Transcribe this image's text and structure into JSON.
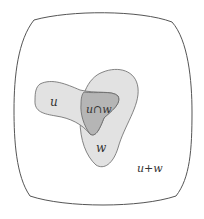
{
  "diagram": {
    "type": "venn",
    "labels": {
      "set_u": "u",
      "intersection": "u∩w",
      "set_w": "w",
      "sum": "u+w"
    },
    "colors": {
      "background": "#ffffff",
      "outline": "#555555",
      "region_fill": "#e2e2e2",
      "intersection_fill": "#b5b5b5",
      "text": "#333333"
    }
  }
}
